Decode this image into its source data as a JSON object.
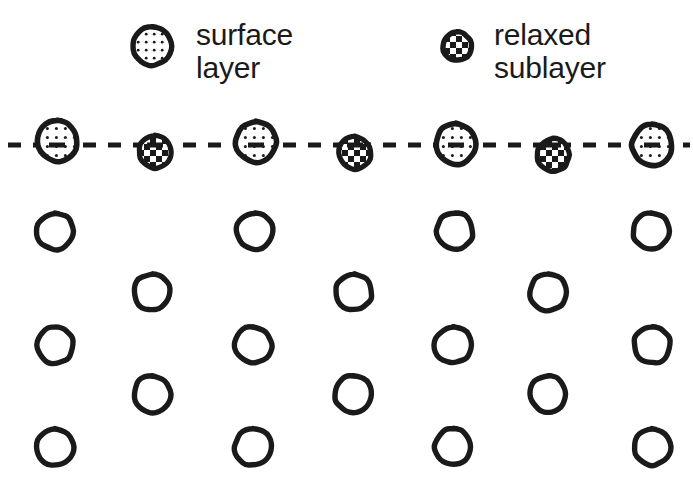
{
  "figure": {
    "background_color": "#ffffff",
    "ink_color": "#1a1a1a",
    "width": 693,
    "height": 489
  },
  "legend": {
    "items": [
      {
        "id": "surface-layer",
        "label": "surface\nlayer",
        "swatch": "stippled-circle-icon",
        "swatch_x": 152,
        "swatch_y": 46,
        "swatch_r": 22
      },
      {
        "id": "relaxed-sublayer",
        "label": "relaxed\nsublayer",
        "swatch": "checkered-circle-icon",
        "swatch_x": 457,
        "swatch_y": 46,
        "swatch_r": 17
      }
    ]
  },
  "reference_line": {
    "name": "dashed-reference-line",
    "y": 145,
    "x_start": 8,
    "x_end": 690,
    "stroke_width": 5,
    "dash": "13 12",
    "color": "#1a1a1a"
  },
  "lattice": {
    "top_row": {
      "name": "surface-row",
      "atoms": [
        {
          "type": "surface",
          "cx": 57,
          "cy": 141,
          "r": 23
        },
        {
          "type": "sublayer",
          "cx": 155,
          "cy": 152,
          "r": 19
        },
        {
          "type": "surface",
          "cx": 256,
          "cy": 142,
          "r": 23
        },
        {
          "type": "sublayer",
          "cx": 355,
          "cy": 153,
          "r": 19
        },
        {
          "type": "surface",
          "cx": 456,
          "cy": 144,
          "r": 23
        },
        {
          "type": "sublayer",
          "cx": 553,
          "cy": 155,
          "r": 19
        },
        {
          "type": "surface",
          "cx": 652,
          "cy": 145,
          "r": 23
        }
      ]
    },
    "bulk_rows": [
      {
        "name": "bulk-row-1",
        "cy": 231,
        "r": 21,
        "centers": [
          55,
          255,
          455,
          651
        ]
      },
      {
        "name": "bulk-row-2",
        "cy": 292,
        "r": 21,
        "centers": [
          152,
          354,
          548
        ]
      },
      {
        "name": "bulk-row-3",
        "cy": 345,
        "r": 21,
        "centers": [
          55,
          253,
          453,
          652
        ]
      },
      {
        "name": "bulk-row-4",
        "cy": 394,
        "r": 21,
        "centers": [
          152,
          353,
          548
        ]
      },
      {
        "name": "bulk-row-5",
        "cy": 447,
        "r": 21,
        "centers": [
          55,
          253,
          453,
          652
        ]
      }
    ]
  }
}
